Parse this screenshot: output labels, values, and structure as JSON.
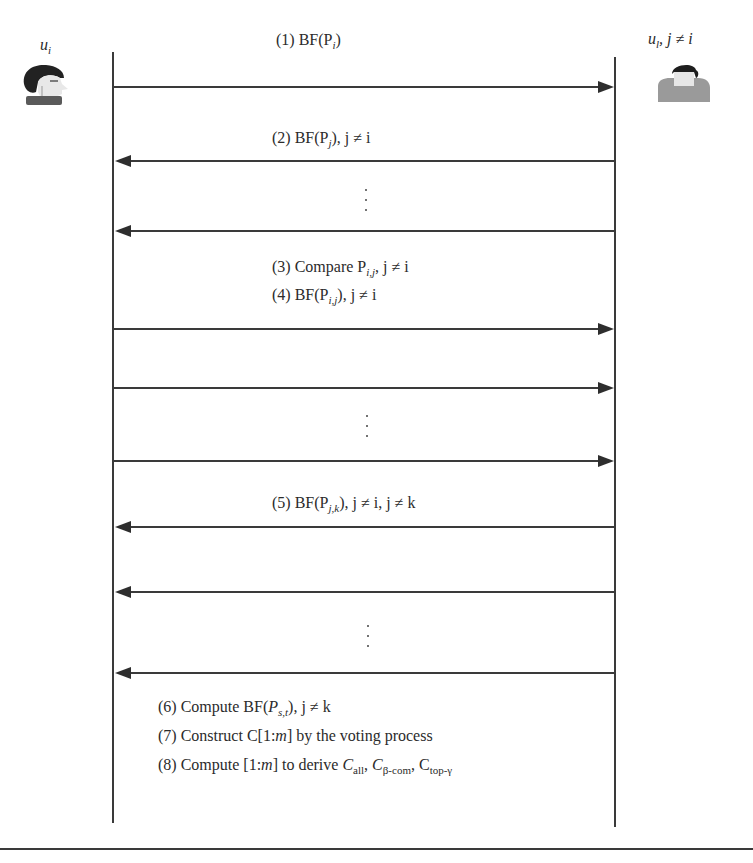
{
  "diagram": {
    "type": "sequence-diagram",
    "actors": {
      "left": {
        "name": "u",
        "name_sub": "i",
        "icon": "person-head-side-profile-icon"
      },
      "right": {
        "name": "u",
        "name_sub": "l",
        "condition": ", j ≠ i",
        "icon": "person-back-view-icon"
      }
    },
    "messages": [
      {
        "step": "(1)",
        "text": "BF(P",
        "sub": "i",
        "tail": ")",
        "direction": "right"
      },
      {
        "step": "(2)",
        "text": "BF(P",
        "sub": "j",
        "tail": "), j ≠ i",
        "direction": "left"
      },
      {
        "step": "",
        "text": "",
        "direction": "left",
        "ellipsis_before": true
      },
      {
        "step": "(3)",
        "text": "Compare P",
        "sub": "i,j",
        "tail": ", j ≠ i",
        "direction": "none"
      },
      {
        "step": "(4)",
        "text": "BF(P",
        "sub": "i,j",
        "tail": "), j ≠ i",
        "direction": "right"
      },
      {
        "step": "",
        "text": "",
        "direction": "right"
      },
      {
        "step": "",
        "text": "",
        "direction": "right",
        "ellipsis_before": true
      },
      {
        "step": "(5)",
        "text": "BF(P",
        "sub": "j,k",
        "tail": "), j ≠ i, j ≠ k",
        "direction": "left"
      },
      {
        "step": "",
        "text": "",
        "direction": "left"
      },
      {
        "step": "",
        "text": "",
        "direction": "left",
        "ellipsis_before": true
      }
    ],
    "final_steps": [
      {
        "step": "(6)",
        "text_a": "Compute BF(",
        "var": "P",
        "sub": "s,t",
        "tail": "), j ≠ k"
      },
      {
        "step": "(7)",
        "text_a": "Construct C[1:",
        "var": "m",
        "tail": "] by the voting process"
      },
      {
        "step": "(8)",
        "text_a": "Compute [1:",
        "var": "m",
        "tail": "] to derive ",
        "c1": "C",
        "c1_sub": "all",
        "c2": "C",
        "c2_sub": "β-com",
        "c3": "C",
        "c3_sub": "top-γ"
      }
    ],
    "colors": {
      "line": "#3a3a3a",
      "text": "#2b2b2b",
      "background": "#ffffff"
    }
  }
}
